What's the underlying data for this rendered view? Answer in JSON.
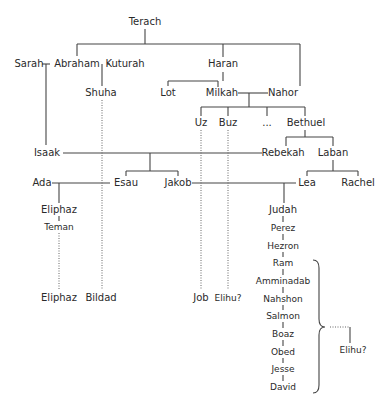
{
  "nodes": {
    "terach": {
      "label": "Terach",
      "x": 145,
      "y": 22
    },
    "sarah": {
      "label": "Sarah",
      "x": 29,
      "y": 64
    },
    "abraham": {
      "label": "Abraham",
      "x": 77,
      "y": 64
    },
    "kuturah": {
      "label": "Kuturah",
      "x": 125,
      "y": 64
    },
    "haran": {
      "label": "Haran",
      "x": 223,
      "y": 64
    },
    "shuha": {
      "label": "Shuha",
      "x": 101,
      "y": 93
    },
    "lot": {
      "label": "Lot",
      "x": 168,
      "y": 93
    },
    "milkah": {
      "label": "Milkah",
      "x": 222,
      "y": 93
    },
    "nahor": {
      "label": "Nahor",
      "x": 283,
      "y": 93
    },
    "uz": {
      "label": "Uz",
      "x": 201,
      "y": 123
    },
    "buz": {
      "label": "Buz",
      "x": 228,
      "y": 123
    },
    "ellipsis": {
      "label": "...",
      "x": 267,
      "y": 123
    },
    "bethuel": {
      "label": "Bethuel",
      "x": 306,
      "y": 123
    },
    "isaak": {
      "label": "Isaak",
      "x": 47,
      "y": 153
    },
    "rebekah": {
      "label": "Rebekah",
      "x": 283,
      "y": 153
    },
    "laban": {
      "label": "Laban",
      "x": 333,
      "y": 153
    },
    "ada": {
      "label": "Ada",
      "x": 42,
      "y": 183
    },
    "esau": {
      "label": "Esau",
      "x": 126,
      "y": 183
    },
    "jakob": {
      "label": "Jakob",
      "x": 178,
      "y": 183
    },
    "lea": {
      "label": "Lea",
      "x": 307,
      "y": 183
    },
    "rachel": {
      "label": "Rachel",
      "x": 358,
      "y": 183
    },
    "eliphaz1": {
      "label": "Eliphaz",
      "x": 59,
      "y": 210
    },
    "teman": {
      "label": "Teman",
      "x": 59,
      "y": 227
    },
    "judah": {
      "label": "Judah",
      "x": 283,
      "y": 210
    },
    "perez": {
      "label": "Perez",
      "x": 283,
      "y": 228
    },
    "hezron": {
      "label": "Hezron",
      "x": 283,
      "y": 246
    },
    "ram": {
      "label": "Ram",
      "x": 283,
      "y": 263
    },
    "amminadab": {
      "label": "Amminadab",
      "x": 283,
      "y": 281
    },
    "nahshon": {
      "label": "Nahshon",
      "x": 283,
      "y": 299
    },
    "salmon": {
      "label": "Salmon",
      "x": 283,
      "y": 316
    },
    "boaz": {
      "label": "Boaz",
      "x": 283,
      "y": 334
    },
    "obed": {
      "label": "Obed",
      "x": 283,
      "y": 352
    },
    "jesse": {
      "label": "Jesse",
      "x": 283,
      "y": 369
    },
    "david": {
      "label": "David",
      "x": 283,
      "y": 387
    },
    "eliphaz2": {
      "label": "Eliphaz",
      "x": 59,
      "y": 298
    },
    "bildad": {
      "label": "Bildad",
      "x": 101,
      "y": 298
    },
    "job": {
      "label": "Job",
      "x": 201,
      "y": 298
    },
    "elihu1": {
      "label": "Elihu?",
      "x": 228,
      "y": 298
    },
    "elihu2": {
      "label": "Elihu?",
      "x": 353,
      "y": 350
    }
  },
  "small_nodes": [
    "perez",
    "hezron",
    "ram",
    "amminadab",
    "nahshon",
    "salmon",
    "boaz",
    "obed",
    "jesse",
    "david",
    "elihu1",
    "elihu2",
    "teman"
  ],
  "solid_edges": [
    [
      145,
      29,
      145,
      44
    ],
    [
      77,
      44,
      300,
      44
    ],
    [
      77,
      44,
      77,
      56
    ],
    [
      223,
      44,
      223,
      57
    ],
    [
      300,
      44,
      300,
      86
    ],
    [
      42,
      64,
      50,
      64
    ],
    [
      46,
      64,
      46,
      145
    ],
    [
      107,
      64,
      110,
      64
    ],
    [
      102,
      64,
      102,
      86
    ],
    [
      168,
      86,
      168,
      81
    ],
    [
      168,
      81,
      218,
      81
    ],
    [
      223,
      72,
      223,
      81
    ],
    [
      218,
      81,
      218,
      87
    ],
    [
      238,
      93,
      268,
      93
    ],
    [
      249,
      93,
      249,
      107
    ],
    [
      201,
      107,
      305,
      107
    ],
    [
      201,
      107,
      201,
      116
    ],
    [
      228,
      107,
      228,
      116
    ],
    [
      267,
      107,
      267,
      116
    ],
    [
      305,
      107,
      305,
      116
    ],
    [
      305,
      130,
      305,
      137
    ],
    [
      286,
      137,
      333,
      137
    ],
    [
      286,
      137,
      286,
      146
    ],
    [
      333,
      137,
      333,
      146
    ],
    [
      315,
      137,
      315,
      137
    ],
    [
      63,
      153,
      262,
      153
    ],
    [
      150,
      153,
      150,
      171
    ],
    [
      126,
      171,
      178,
      171
    ],
    [
      126,
      171,
      126,
      176
    ],
    [
      178,
      171,
      178,
      176
    ],
    [
      52,
      183,
      110,
      183
    ],
    [
      59,
      183,
      59,
      203
    ],
    [
      192,
      183,
      296,
      183
    ],
    [
      284,
      183,
      284,
      203
    ],
    [
      333,
      160,
      333,
      171
    ],
    [
      307,
      171,
      358,
      171
    ],
    [
      307,
      171,
      307,
      176
    ],
    [
      358,
      171,
      358,
      176
    ],
    [
      59,
      216,
      59,
      221
    ],
    [
      283,
      216,
      283,
      222
    ],
    [
      283,
      234,
      283,
      240
    ],
    [
      283,
      252,
      283,
      257
    ],
    [
      283,
      269,
      283,
      275
    ],
    [
      283,
      287,
      283,
      293
    ],
    [
      283,
      305,
      283,
      310
    ],
    [
      283,
      322,
      283,
      328
    ],
    [
      283,
      340,
      283,
      346
    ],
    [
      283,
      358,
      283,
      363
    ],
    [
      283,
      375,
      283,
      381
    ],
    [
      350,
      327,
      350,
      343
    ]
  ],
  "dotted_edges": [
    [
      102,
      100,
      102,
      290
    ],
    [
      59,
      233,
      59,
      290
    ],
    [
      201,
      130,
      201,
      290
    ],
    [
      228,
      130,
      228,
      290
    ],
    [
      330,
      327,
      350,
      327
    ]
  ],
  "brace": {
    "x": 319,
    "top": 260,
    "mid": 327,
    "bottom": 393
  }
}
